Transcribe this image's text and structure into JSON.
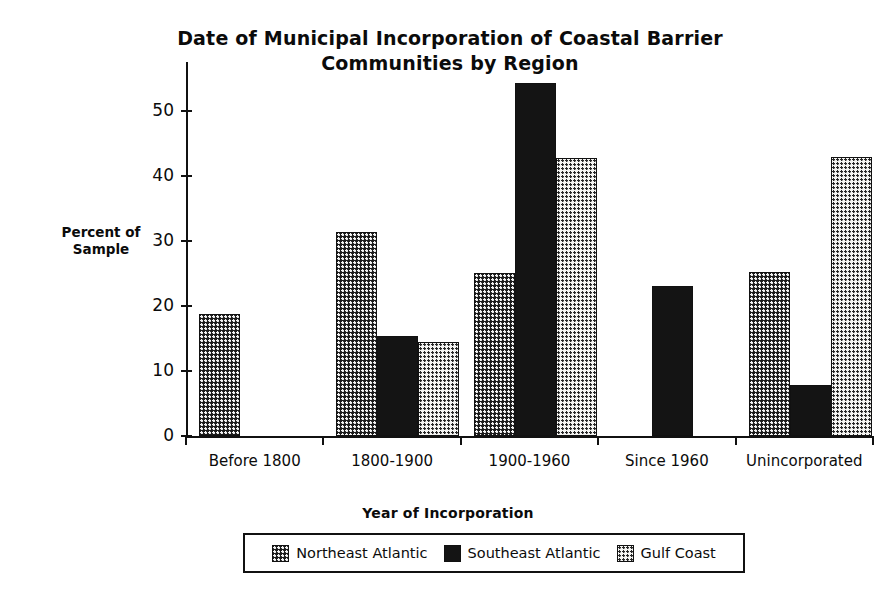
{
  "chart_data": {
    "type": "bar",
    "title": "Date of Municipal Incorporation of Coastal Barrier Communities by Region",
    "title_line1": "Date of Municipal Incorporation of Coastal Barrier",
    "title_line2": "Communities by Region",
    "xlabel": "Year of Incorporation",
    "ylabel": "Percent of Sample",
    "ylabel_line1": "Percent of",
    "ylabel_line2": "Sample",
    "categories": [
      "Before 1800",
      "1800-1900",
      "1900-1960",
      "Since 1960",
      "Unincorporated"
    ],
    "series": [
      {
        "name": "Northeast Atlantic",
        "values": [
          18.7,
          31.3,
          25.0,
          0,
          25.2
        ]
      },
      {
        "name": "Southeast Atlantic",
        "values": [
          0,
          15.3,
          54.2,
          23.1,
          7.9
        ]
      },
      {
        "name": "Gulf Coast",
        "values": [
          0,
          14.4,
          42.8,
          0,
          42.9
        ]
      }
    ],
    "ylim": [
      0,
      57.5
    ],
    "yticks": [
      0,
      10,
      20,
      30,
      40,
      50
    ],
    "ytick_labels": [
      "0",
      "10",
      "20",
      "30",
      "40",
      "50"
    ],
    "grid": false,
    "legend_position": "bottom"
  },
  "legend": {
    "items": [
      {
        "label": "Northeast Atlantic",
        "pattern": "dark-checker"
      },
      {
        "label": "Southeast Atlantic",
        "pattern": "solid-black"
      },
      {
        "label": "Gulf Coast",
        "pattern": "light-dotted"
      }
    ]
  },
  "colors": {
    "ink": "#111111",
    "northeast_atlantic": "#1a1a1a",
    "southeast_atlantic": "#141414",
    "gulf_coast": "#f4f4f2",
    "background": "#ffffff"
  }
}
